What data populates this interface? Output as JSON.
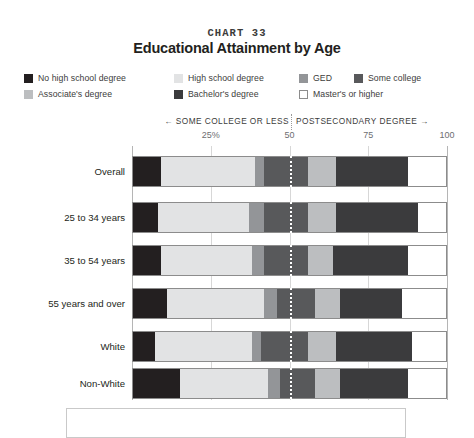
{
  "header": {
    "chart_number": "CHART 33",
    "title": "Educational Attainment by Age"
  },
  "axis": {
    "left_direction_label": "← SOME COLLEGE OR LESS",
    "right_direction_label": "POSTSECONDARY DEGREE →",
    "tick_labels": [
      "25%",
      "50",
      "75",
      "100"
    ],
    "tick_values": [
      25,
      50,
      75,
      100
    ]
  },
  "legend": {
    "items": [
      {
        "label": "No high school degree",
        "color": "#231f20",
        "style": "solid",
        "x": 0,
        "y": 0
      },
      {
        "label": "High school degree",
        "color": "#e2e3e4",
        "style": "solid",
        "x": 150,
        "y": 0
      },
      {
        "label": "GED",
        "color": "#939598",
        "style": "solid",
        "x": 275,
        "y": 0
      },
      {
        "label": "Some college",
        "color": "#58595b",
        "style": "solid",
        "x": 330,
        "y": 0
      },
      {
        "label": "Associate's degree",
        "color": "#bcbec0",
        "style": "solid",
        "x": 0,
        "y": 16
      },
      {
        "label": "Bachelor's degree",
        "color": "#3b3b3d",
        "style": "solid",
        "x": 150,
        "y": 16
      },
      {
        "label": "Master's or higher",
        "color": "#ffffff",
        "style": "outline",
        "x": 275,
        "y": 16
      }
    ]
  },
  "footnote": {
    "text": ""
  },
  "chart_data": {
    "type": "bar",
    "orientation": "horizontal",
    "stacked": true,
    "stack_total": 100,
    "title": "Educational Attainment by Age",
    "subtitle": "CHART 33",
    "xlabel": "",
    "ylabel": "",
    "xlim": [
      0,
      100
    ],
    "grid": true,
    "legend_position": "top",
    "divider_at": 50,
    "units": "percent",
    "categories": [
      "Overall",
      "25 to 34 years",
      "35 to 54 years",
      "55 years and over",
      "White",
      "Non-White"
    ],
    "series": [
      {
        "name": "No high school degree",
        "color": "#231f20",
        "values": [
          9,
          8,
          9,
          11,
          7,
          15
        ]
      },
      {
        "name": "High school degree",
        "color": "#e2e3e4",
        "values": [
          30,
          29,
          29,
          31,
          31,
          28
        ]
      },
      {
        "name": "GED",
        "color": "#939598",
        "values": [
          3,
          5,
          4,
          4,
          3,
          4
        ]
      },
      {
        "name": "Some college",
        "color": "#58595b",
        "values": [
          14,
          14,
          14,
          12,
          15,
          11
        ]
      },
      {
        "name": "Associate's degree",
        "color": "#bcbec0",
        "values": [
          9,
          9,
          8,
          8,
          9,
          8
        ]
      },
      {
        "name": "Bachelor's degree",
        "color": "#3b3b3d",
        "values": [
          23,
          26,
          24,
          20,
          24,
          22
        ]
      },
      {
        "name": "Master's or higher",
        "color": "#ffffff",
        "values": [
          12,
          9,
          12,
          14,
          11,
          12
        ]
      }
    ]
  }
}
